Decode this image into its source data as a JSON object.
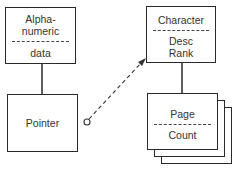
{
  "diagram": {
    "nodes": [
      {
        "id": "alphanumeric",
        "label_top_1": "Alpha-",
        "label_top_2": "numeric",
        "label_bottom": "data"
      },
      {
        "id": "pointer",
        "label": "Pointer"
      },
      {
        "id": "character",
        "label_top": "Character",
        "label_bottom_1": "Desc",
        "label_bottom_2": "Rank"
      },
      {
        "id": "page",
        "label_top": "Page",
        "label_bottom": "Count",
        "stacked": true
      }
    ],
    "edges": [
      {
        "from": "alphanumeric",
        "to": "pointer",
        "style": "solid"
      },
      {
        "from": "character",
        "to": "page",
        "style": "solid"
      },
      {
        "from": "pointer",
        "to": "character",
        "style": "dashed",
        "start": "circle",
        "end": "arrow"
      }
    ],
    "colors": {
      "line": "#2a2a2a",
      "background": "#ffffff"
    }
  }
}
